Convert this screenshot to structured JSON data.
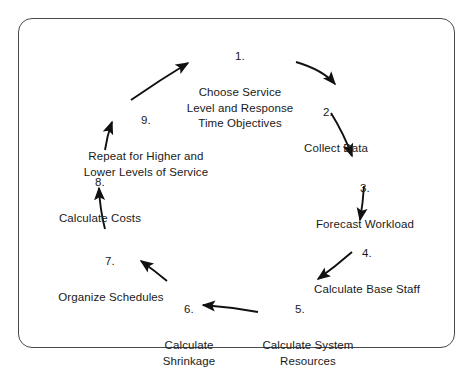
{
  "diagram": {
    "shape": "cycle",
    "frame_color": "#4a4a4a",
    "text_color": "#1a1a1a",
    "background": "#ffffff",
    "arrow_color": "#111111",
    "steps": [
      {
        "number": "1.",
        "label": "Choose Service\nLevel and Response\nTime Objectives"
      },
      {
        "number": "2.",
        "label": "Collect Data"
      },
      {
        "number": "3.",
        "label": "Forecast Workload"
      },
      {
        "number": "4.",
        "label": "Calculate Base Staff"
      },
      {
        "number": "5.",
        "label": "Calculate System\nResources"
      },
      {
        "number": "6.",
        "label": "Calculate\nShrinkage"
      },
      {
        "number": "7.",
        "label": "Organize Schedules"
      },
      {
        "number": "8.",
        "label": "Calculate Costs"
      },
      {
        "number": "9.",
        "label": "Repeat for Higher and\nLower Levels of Service"
      }
    ],
    "connections": [
      {
        "from": "1",
        "to": "2",
        "style": "curved-arrow"
      },
      {
        "from": "2",
        "to": "3",
        "style": "curved-arrow"
      },
      {
        "from": "3",
        "to": "4",
        "style": "curved-arrow"
      },
      {
        "from": "4",
        "to": "5",
        "style": "curved-arrow"
      },
      {
        "from": "5",
        "to": "6",
        "style": "curved-arrow"
      },
      {
        "from": "6",
        "to": "7",
        "style": "curved-arrow"
      },
      {
        "from": "7",
        "to": "8",
        "style": "curved-arrow"
      },
      {
        "from": "8",
        "to": "9",
        "style": "curved-arrow"
      },
      {
        "from": "9",
        "to": "1",
        "style": "curved-arrow"
      }
    ]
  }
}
